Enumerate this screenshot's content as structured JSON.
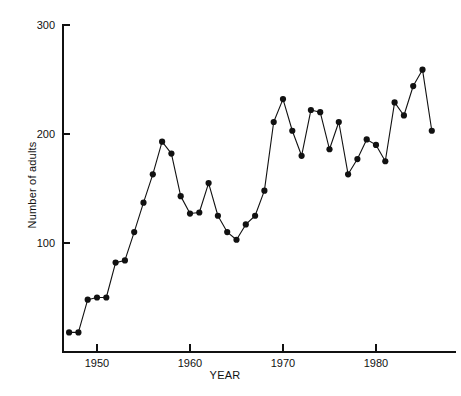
{
  "chart_data": {
    "type": "line",
    "title": "",
    "subtitle": "",
    "xlabel": "YEAR",
    "ylabel": "Number of adults",
    "xlim": [
      1946,
      1987
    ],
    "ylim": [
      0,
      300
    ],
    "grid": false,
    "legend": null,
    "marker": "filled-circle",
    "x_ticks": [
      1950,
      1960,
      1970,
      1980
    ],
    "x_tick_labels": [
      "1950",
      "1960",
      "1970",
      "1980"
    ],
    "y_ticks": [
      100,
      200,
      300
    ],
    "y_tick_labels": [
      "100",
      "200",
      "300"
    ],
    "x": [
      1947,
      1948,
      1949,
      1950,
      1951,
      1952,
      1953,
      1954,
      1955,
      1956,
      1957,
      1958,
      1959,
      1960,
      1961,
      1962,
      1963,
      1964,
      1965,
      1966,
      1967,
      1968,
      1969,
      1970,
      1971,
      1972,
      1973,
      1974,
      1975,
      1976,
      1977,
      1978,
      1979,
      1980,
      1981,
      1982,
      1983,
      1984,
      1985,
      1986
    ],
    "values": [
      18,
      18,
      48,
      50,
      50,
      82,
      84,
      110,
      137,
      163,
      193,
      182,
      143,
      127,
      128,
      155,
      125,
      110,
      103,
      117,
      125,
      148,
      211,
      232,
      203,
      180,
      222,
      220,
      186,
      211,
      163,
      177,
      195,
      190,
      175,
      229,
      217,
      244,
      259,
      203
    ],
    "series": [
      {
        "name": "Number of adults",
        "values": [
          18,
          18,
          48,
          50,
          50,
          82,
          84,
          110,
          137,
          163,
          193,
          182,
          143,
          127,
          128,
          155,
          125,
          110,
          103,
          117,
          125,
          148,
          211,
          232,
          203,
          180,
          222,
          220,
          186,
          211,
          163,
          177,
          195,
          190,
          175,
          229,
          217,
          244,
          259,
          203
        ]
      }
    ]
  },
  "colors": {
    "ink": "#111111",
    "background": "#ffffff"
  }
}
